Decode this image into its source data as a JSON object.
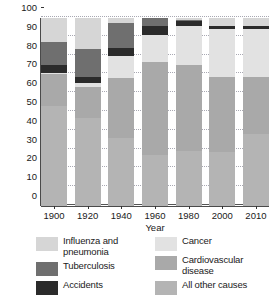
{
  "chart_data": {
    "type": "bar",
    "subtype": "stacked-bar-100",
    "title": "",
    "xlabel": "Year",
    "ylabel": "Percent of all deaths",
    "categories": [
      "1900",
      "1920",
      "1940",
      "1960",
      "1980",
      "2000",
      "2010"
    ],
    "ylim": [
      0,
      100
    ],
    "yticks": [
      0,
      10,
      20,
      30,
      40,
      50,
      60,
      70,
      80,
      90,
      100
    ],
    "ytick_labels": [
      "0",
      "10",
      "20",
      "30",
      "40",
      "50",
      "60",
      "70",
      "80",
      "90",
      "100"
    ],
    "grid": true,
    "legend_position": "below",
    "stack_order_bottom_to_top": [
      "All other causes",
      "Cardiovascular disease",
      "Cancer",
      "Accidents",
      "Tuberculosis",
      "Influenza and pneumonia"
    ],
    "series": [
      {
        "name": "All other causes",
        "color": "#b4b4b4",
        "values": [
          53,
          47,
          36,
          27,
          29,
          28.5,
          38.5
        ]
      },
      {
        "name": "Cardiovascular disease",
        "color": "#a9a9a9",
        "values": [
          17,
          16.5,
          32,
          49.5,
          46,
          40,
          30
        ]
      },
      {
        "name": "Cancer",
        "color": "#e2e2e2",
        "values": [
          1,
          2,
          12,
          14.5,
          20.5,
          25.5,
          25.5
        ]
      },
      {
        "name": "Accidents",
        "color": "#2b2b2b",
        "values": [
          4,
          3,
          4,
          5,
          3,
          2,
          2
        ]
      },
      {
        "name": "Tuberculosis",
        "color": "#6f6f6f",
        "values": [
          12,
          15,
          13.5,
          4,
          0.5,
          0,
          0
        ]
      },
      {
        "name": "Influenza and pneumonia",
        "color": "#d6d6d6",
        "values": [
          13,
          16.5,
          2.5,
          0,
          1,
          4,
          4
        ]
      }
    ]
  },
  "legend": {
    "column_left": [
      {
        "label": "Influenza and pneumonia",
        "color": "#d6d6d6"
      },
      {
        "label": "Tuberculosis",
        "color": "#6f6f6f"
      },
      {
        "label": "Accidents",
        "color": "#2b2b2b"
      }
    ],
    "column_right": [
      {
        "label": "Cancer",
        "color": "#e2e2e2"
      },
      {
        "label": "Cardiovascular disease",
        "color": "#a9a9a9"
      },
      {
        "label": "All other causes",
        "color": "#b4b4b4"
      }
    ]
  },
  "colors": {
    "background": "#ffffff",
    "axis": "#4a4a4a",
    "grid": "#9a9aa5",
    "text": "#1a1a1a"
  }
}
